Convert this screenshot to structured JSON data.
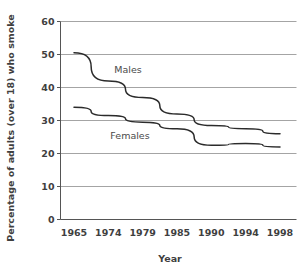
{
  "chart_data": {
    "type": "line",
    "title": "",
    "xlabel": "Year",
    "ylabel": "Percentage of adults (over 18) who smoke",
    "categories": [
      "1965",
      "1974",
      "1979",
      "1985",
      "1990",
      "1994",
      "1998"
    ],
    "ylim": [
      0,
      60
    ],
    "yticks": [
      "0",
      "10",
      "20",
      "30",
      "40",
      "50",
      "60"
    ],
    "grid": "horizontal",
    "legend": "inline-annotations",
    "line_color": "#2b2b2b",
    "grid_color": "#9a9a9a",
    "axis_color": "#555555",
    "background": "#ffffff",
    "series": [
      {
        "name": "Males",
        "label": "Males",
        "values": [
          50.5,
          42.0,
          37.0,
          32.0,
          28.5,
          27.5,
          26.0
        ]
      },
      {
        "name": "Females",
        "label": "Females",
        "values": [
          34.0,
          31.5,
          29.5,
          27.5,
          22.5,
          23.0,
          22.0
        ]
      }
    ]
  }
}
